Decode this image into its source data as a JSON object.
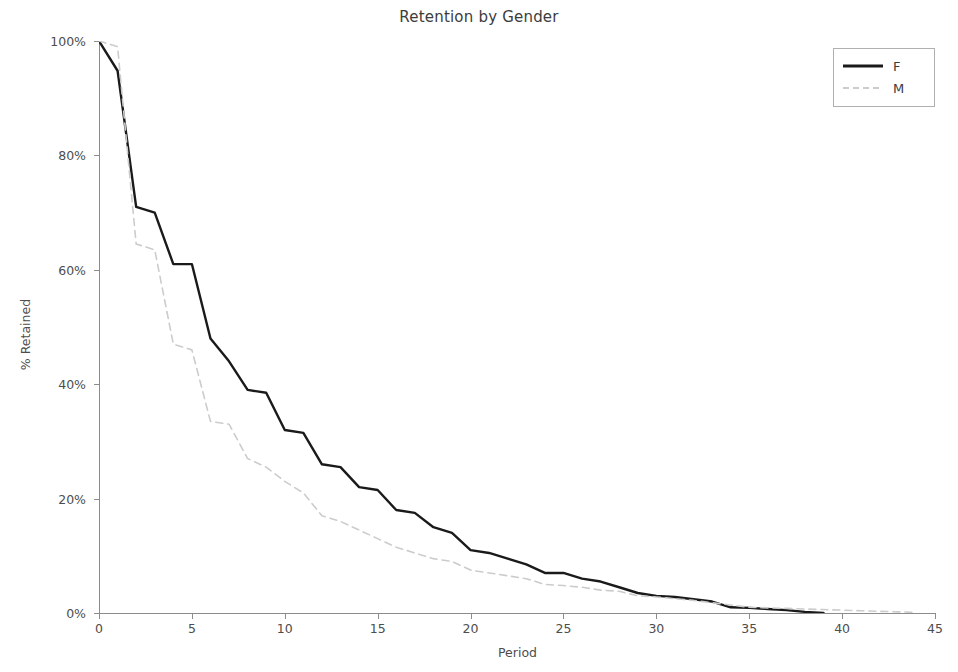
{
  "chart_data": {
    "type": "line",
    "title": "Retention by Gender",
    "xlabel": "Period",
    "ylabel": "% Retained",
    "xlim": [
      0,
      45
    ],
    "ylim": [
      0,
      100
    ],
    "grid": false,
    "legend_position": "upper right",
    "xticks": [
      0,
      5,
      10,
      15,
      20,
      25,
      30,
      35,
      40,
      45
    ],
    "xticklabels": [
      "0",
      "5",
      "10",
      "15",
      "20",
      "25",
      "30",
      "35",
      "40",
      "45"
    ],
    "yticks": [
      0,
      20,
      40,
      60,
      80,
      100
    ],
    "yticklabels": [
      "0%",
      "20%",
      "40%",
      "60%",
      "80%",
      "100%"
    ],
    "series": [
      {
        "name": "F",
        "color": "#1a1a1a",
        "linestyle": "solid",
        "linewidth": 2.4,
        "x": [
          0,
          1,
          2,
          3,
          4,
          5,
          6,
          7,
          8,
          9,
          10,
          11,
          12,
          13,
          14,
          15,
          16,
          17,
          18,
          19,
          20,
          21,
          22,
          23,
          24,
          25,
          26,
          27,
          28,
          29,
          30,
          31,
          32,
          33,
          34,
          35,
          36,
          37,
          38,
          39
        ],
        "values": [
          100.0,
          94.8,
          71.0,
          70.0,
          61.0,
          61.0,
          48.0,
          44.0,
          39.0,
          38.5,
          32.0,
          31.5,
          26.0,
          25.5,
          22.0,
          21.5,
          18.0,
          17.5,
          15.0,
          14.0,
          11.0,
          10.5,
          9.5,
          8.5,
          7.0,
          7.0,
          6.0,
          5.5,
          4.5,
          3.5,
          3.0,
          2.8,
          2.4,
          2.0,
          1.0,
          0.9,
          0.7,
          0.5,
          0.2,
          0.0
        ]
      },
      {
        "name": "M",
        "color": "#cccccc",
        "linestyle": "dashed",
        "linewidth": 1.6,
        "x": [
          0,
          1,
          2,
          3,
          4,
          5,
          6,
          7,
          8,
          9,
          10,
          11,
          12,
          13,
          14,
          15,
          16,
          17,
          18,
          19,
          20,
          21,
          22,
          23,
          24,
          25,
          26,
          27,
          28,
          29,
          30,
          31,
          32,
          33,
          34,
          35,
          36,
          37,
          38,
          39,
          40,
          41,
          42,
          43,
          44
        ],
        "values": [
          100.0,
          99.0,
          64.5,
          63.5,
          47.0,
          46.0,
          33.5,
          33.0,
          27.0,
          25.5,
          23.0,
          21.0,
          17.0,
          16.0,
          14.5,
          13.0,
          11.5,
          10.5,
          9.5,
          9.0,
          7.5,
          7.0,
          6.5,
          6.0,
          5.0,
          4.8,
          4.5,
          4.0,
          3.8,
          3.0,
          2.8,
          2.5,
          2.2,
          1.8,
          1.4,
          1.0,
          0.9,
          0.8,
          0.7,
          0.6,
          0.5,
          0.4,
          0.3,
          0.2,
          0.1
        ]
      }
    ]
  },
  "legend": {
    "entries": [
      {
        "label": "F"
      },
      {
        "label": "M"
      }
    ]
  },
  "figure": {
    "background": "#ffffff",
    "axis_color": "#8c8c8c",
    "text_color": "#4d4d4d"
  }
}
